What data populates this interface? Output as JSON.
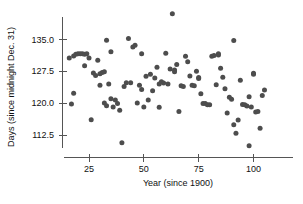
{
  "chart_data": {
    "type": "scatter",
    "title": "",
    "xlabel": "Year (since 1900)",
    "ylabel": "Days (since midnight Dec. 31)",
    "xlim": [
      13,
      110
    ],
    "ylim": [
      108.5,
      142
    ],
    "xticks": [
      25,
      50,
      75,
      100
    ],
    "xtick_labels": [
      "25",
      "50",
      "75",
      "100"
    ],
    "yticks": [
      112.5,
      120.0,
      127.5,
      135.0
    ],
    "ytick_labels": [
      "112.5",
      "120.0",
      "127.5",
      "135.0"
    ],
    "grid": false,
    "legend": null,
    "marker": "circle",
    "marker_color": "#4d4d4d",
    "marker_size": 5,
    "points": [
      [
        16,
        130.6
      ],
      [
        17,
        119.8
      ],
      [
        18,
        131.1
      ],
      [
        18,
        122.3
      ],
      [
        19,
        131.5
      ],
      [
        20,
        131.6
      ],
      [
        21,
        131.6
      ],
      [
        22,
        131.6
      ],
      [
        23,
        131.5
      ],
      [
        23,
        128.8
      ],
      [
        24,
        131.6
      ],
      [
        25,
        130.6
      ],
      [
        26,
        116.1
      ],
      [
        27,
        127.1
      ],
      [
        28,
        126.5
      ],
      [
        29,
        130.1
      ],
      [
        30,
        126.9
      ],
      [
        30,
        124.2
      ],
      [
        31,
        127.2
      ],
      [
        32,
        120.0
      ],
      [
        32,
        127.4
      ],
      [
        33,
        134.8
      ],
      [
        33,
        119.4
      ],
      [
        34,
        124.5
      ],
      [
        35,
        132.1
      ],
      [
        35,
        121.0
      ],
      [
        36,
        119.1
      ],
      [
        37,
        120.7
      ],
      [
        38,
        119.9
      ],
      [
        39,
        118.3
      ],
      [
        40,
        110.7
      ],
      [
        41,
        123.9
      ],
      [
        42,
        124.8
      ],
      [
        43,
        135.2
      ],
      [
        44,
        124.8
      ],
      [
        45,
        133.2
      ],
      [
        46,
        133.6
      ],
      [
        47,
        120.0
      ],
      [
        48,
        124.2
      ],
      [
        49,
        123.2
      ],
      [
        49,
        131.6
      ],
      [
        50,
        119.1
      ],
      [
        51,
        126.3
      ],
      [
        52,
        120.7
      ],
      [
        53,
        126.8
      ],
      [
        54,
        122.9
      ],
      [
        55,
        125.9
      ],
      [
        56,
        128.4
      ],
      [
        57,
        124.5
      ],
      [
        57,
        119.0
      ],
      [
        58,
        125.0
      ],
      [
        59,
        124.7
      ],
      [
        60,
        131.7
      ],
      [
        61,
        124.5
      ],
      [
        62,
        128.0
      ],
      [
        63,
        141.0
      ],
      [
        64,
        127.8
      ],
      [
        64,
        127.4
      ],
      [
        65,
        129.1
      ],
      [
        66,
        118.0
      ],
      [
        67,
        124.1
      ],
      [
        68,
        123.9
      ],
      [
        69,
        131.0
      ],
      [
        70,
        129.7
      ],
      [
        71,
        126.4
      ],
      [
        72,
        124.2
      ],
      [
        73,
        124.1
      ],
      [
        74,
        127.5
      ],
      [
        75,
        126.0
      ],
      [
        75,
        125.8
      ],
      [
        76,
        122.2
      ],
      [
        77,
        119.9
      ],
      [
        78,
        119.9
      ],
      [
        79,
        119.6
      ],
      [
        80,
        119.6
      ],
      [
        81,
        131.0
      ],
      [
        82,
        131.2
      ],
      [
        83,
        124.3
      ],
      [
        84,
        131.3
      ],
      [
        84,
        131.6
      ],
      [
        85,
        128.2
      ],
      [
        86,
        126.1
      ],
      [
        87,
        123.4
      ],
      [
        88,
        117.7
      ],
      [
        89,
        121.4
      ],
      [
        90,
        120.9
      ],
      [
        91,
        114.9
      ],
      [
        91,
        134.7
      ],
      [
        92,
        112.9
      ],
      [
        93,
        116.0
      ],
      [
        94,
        125.4
      ],
      [
        95,
        119.7
      ],
      [
        96,
        119.6
      ],
      [
        97,
        119.3
      ],
      [
        98,
        121.5
      ],
      [
        98,
        110.0
      ],
      [
        99,
        119.1
      ],
      [
        100,
        127.0
      ],
      [
        100,
        126.8
      ],
      [
        101,
        117.9
      ],
      [
        102,
        118.0
      ],
      [
        103,
        114.1
      ],
      [
        104,
        121.8
      ],
      [
        105,
        123.1
      ]
    ]
  },
  "axes": {
    "y_title": "Days (since midnight Dec. 31)",
    "x_title": "Year (since 1900)"
  }
}
